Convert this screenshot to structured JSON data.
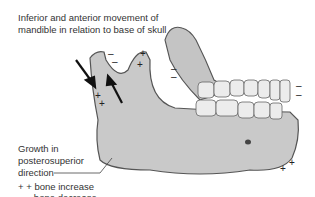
{
  "title_line1": "Inferior and anterior movement of",
  "title_line2": "mandible in relation to base of skull",
  "growth_line1": "Growth in",
  "growth_line2": "posterosuperior",
  "growth_line3": "direction",
  "legend": {
    "increase_symbol": "+ +",
    "increase_label": "bone increase",
    "decrease_symbol": "– –",
    "decrease_label": "bone decrease"
  },
  "colors": {
    "bone": "#c9c9c9",
    "bone_dark": "#a9a9a9",
    "outline": "#555555",
    "teeth": "#ececec"
  }
}
